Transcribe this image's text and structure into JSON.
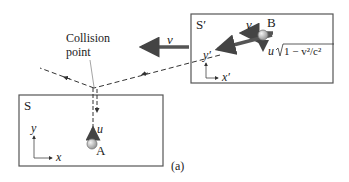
{
  "frames": {
    "S": {
      "label": "S",
      "axis_x": "x",
      "axis_y": "y"
    },
    "S_prime": {
      "label": "S′",
      "axis_x": "x′",
      "axis_y": "y′"
    }
  },
  "particles": {
    "A": {
      "label": "A",
      "velocity_label": "u"
    },
    "B": {
      "label": "B",
      "velocity_label_prefix": "u",
      "velocity_label_radicand": "1 − v²/c²"
    }
  },
  "velocities": {
    "frame_velocity": "v",
    "B_velocity": "v"
  },
  "annotation": {
    "line1": "Collision",
    "line2": "point"
  },
  "figure_label": "(a)",
  "colors": {
    "frame_border": "#555555",
    "arrow": "#555555",
    "dashed": "#333333",
    "ball": "#bbbbbb"
  }
}
